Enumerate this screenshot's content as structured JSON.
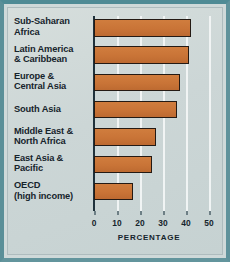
{
  "chart_data": {
    "type": "bar",
    "orientation": "horizontal",
    "title": "",
    "xlabel": "PERCENTAGE",
    "ylabel": "",
    "xlim": [
      0,
      50
    ],
    "grid": true,
    "legend": "none",
    "xticks": [
      "0",
      "10",
      "20",
      "30",
      "40",
      "50"
    ],
    "xtick_values": [
      0,
      10,
      20,
      30,
      40,
      50
    ],
    "categories": [
      "Sub-Saharan\nAfrica",
      "Latin America\n& Caribbean",
      "Europe &\nCentral Asia",
      "South Asia",
      "Middle East &\nNorth Africa",
      "East Asia &\nPacific",
      "OECD\n(high income)"
    ],
    "values": [
      42,
      41.5,
      37.5,
      36,
      27,
      25,
      17
    ],
    "bar_color": "#c97437",
    "bar_outline_color": "#241a14",
    "gridline_color": "#f2f6f5",
    "axis_color": "#20323c",
    "background_color": "#cfd9d9",
    "frame_color": "#5a8f98",
    "text_color": "#16242c"
  }
}
